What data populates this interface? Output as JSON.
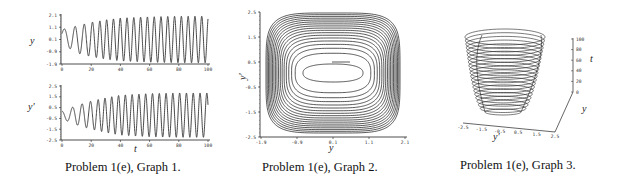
{
  "captions": [
    "Problem 1(e), Graph 1.",
    "Problem 1(e), Graph 2.",
    "Problem 1(e), Graph 3."
  ],
  "colors": {
    "line": "#333333",
    "axis": "#222222",
    "background": "#ffffff"
  },
  "chart_data": [
    {
      "type": "line",
      "title": "Problem 1(e), Graph 1 (top)",
      "xlabel": "",
      "ylabel": "y",
      "xlim": [
        0,
        100
      ],
      "ylim": [
        -1.9,
        2.1
      ],
      "xticks": [
        "0",
        "20",
        "40",
        "60",
        "80",
        "100"
      ],
      "yticks": [
        "2.1",
        "1.1",
        "0.1",
        "-0.9",
        "-1.9"
      ],
      "description": "Oscillation in y vs t with growing amplitude approaching a limit cycle (~±1.9); about 22 periods over t in [0,100]",
      "series": [
        {
          "name": "y(t)",
          "x": [
            0,
            5,
            10,
            20,
            30,
            40,
            60,
            80,
            100
          ],
          "amplitude": [
            0.6,
            0.8,
            1.1,
            1.4,
            1.6,
            1.75,
            1.85,
            1.9,
            1.9
          ]
        }
      ]
    },
    {
      "type": "line",
      "title": "Problem 1(e), Graph 1 (bottom)",
      "xlabel": "t",
      "ylabel": "y'",
      "xlim": [
        0,
        100
      ],
      "ylim": [
        -2.5,
        2.5
      ],
      "xticks": [
        "0",
        "20",
        "40",
        "60",
        "80",
        "100"
      ],
      "yticks": [
        "2.5",
        "1.5",
        "0.5",
        "-0.5",
        "-1.5",
        "-2.5"
      ],
      "description": "Oscillation in y' vs t with growing amplitude approaching ~±2.1",
      "series": [
        {
          "name": "y'(t)",
          "x": [
            0,
            5,
            10,
            20,
            30,
            40,
            60,
            80,
            100
          ],
          "amplitude": [
            0.4,
            0.6,
            0.9,
            1.3,
            1.6,
            1.85,
            2.0,
            2.05,
            2.05
          ]
        }
      ]
    },
    {
      "type": "line",
      "title": "Problem 1(e), Graph 2 (phase plane)",
      "xlabel": "y",
      "ylabel": "y'",
      "xlim": [
        -1.9,
        2.1
      ],
      "ylim": [
        -2.5,
        2.5
      ],
      "xticks": [
        "-1.9",
        "-0.9",
        "0.1",
        "1.1",
        "2.1"
      ],
      "yticks": [
        "2.5",
        "1.5",
        "0.5",
        "-0.5",
        "-1.5",
        "-2.5"
      ],
      "description": "Trajectory spiraling outward from near (0.2, 0.5) to a rounded-rectangular limit cycle spanning y in ~[-1.6, 1.8], y' in ~[-2.1, 2.0]"
    },
    {
      "type": "line",
      "title": "Problem 1(e), Graph 3 (3D)",
      "xlabel": "y'",
      "ylabel": "y",
      "zlabel": "t",
      "zlim": [
        0,
        100
      ],
      "zticks": [
        "0",
        "20",
        "40",
        "60",
        "80",
        "100"
      ],
      "description": "3D trajectory (y', y, t) forming a widening bowl of stacked loops as t increases from 0 to 100"
    }
  ]
}
